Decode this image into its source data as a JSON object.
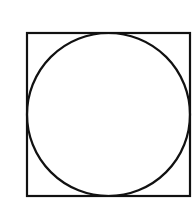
{
  "diagram": {
    "background": "#ffffff",
    "stroke_color": "#111111",
    "square": {
      "x": 27,
      "y": 33,
      "width": 163,
      "height": 163,
      "stroke_width": 2.2
    },
    "circle": {
      "cx": 108.5,
      "cy": 114.5,
      "r": 81.5,
      "stroke_width": 2.2
    }
  }
}
